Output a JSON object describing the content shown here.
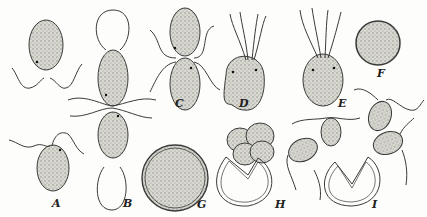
{
  "figure": {
    "labels": [
      {
        "id": "A",
        "text": "A",
        "x": 52,
        "y": 198
      },
      {
        "id": "B",
        "text": "B",
        "x": 123,
        "y": 198
      },
      {
        "id": "C",
        "text": "C",
        "x": 175,
        "y": 98
      },
      {
        "id": "D",
        "text": "D",
        "x": 239,
        "y": 98
      },
      {
        "id": "E",
        "text": "E",
        "x": 338,
        "y": 98
      },
      {
        "id": "F",
        "text": "F",
        "x": 377,
        "y": 68
      },
      {
        "id": "G",
        "text": "G",
        "x": 197,
        "y": 199
      },
      {
        "id": "H",
        "text": "H",
        "x": 275,
        "y": 199
      },
      {
        "id": "I",
        "text": "I",
        "x": 372,
        "y": 199
      }
    ],
    "colors": {
      "ink": "#3a3a3a",
      "stipple": "#b8b8b0",
      "paper": "#fdfdfb"
    }
  }
}
